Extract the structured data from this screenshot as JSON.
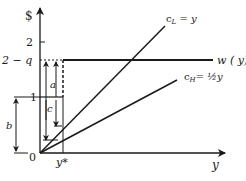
{
  "diagram": {
    "y_axis_label": "$",
    "x_axis_label": "y",
    "origin_label": "0",
    "y_ticks": [
      {
        "label": "2",
        "value": 2
      },
      {
        "label": "2 − q",
        "value": 1.6
      },
      {
        "label": "1",
        "value": 1
      }
    ],
    "x_ticks": [
      {
        "label": "y*",
        "value": 0.28
      }
    ],
    "curves": [
      {
        "id": "cL",
        "label": "c_L = y",
        "label_main": "c",
        "label_sub": "L",
        "label_rest": " = y",
        "slope": 1
      },
      {
        "id": "cH",
        "label": "c_H = ½y",
        "label_main": "c",
        "label_sub": "H",
        "label_rest": "= ½y",
        "slope": 0.5
      },
      {
        "id": "w",
        "label": "w ( y)",
        "level": 1.6
      }
    ],
    "brackets": [
      {
        "label": "a",
        "from": "1",
        "to": "2 − q"
      },
      {
        "label": "b",
        "from": "0",
        "to": "1"
      },
      {
        "label": "c",
        "from": "2 − q",
        "to": "c_H(y*)"
      }
    ],
    "colors": {
      "ink": "#1a1a1a",
      "background": "#ffffff"
    }
  }
}
